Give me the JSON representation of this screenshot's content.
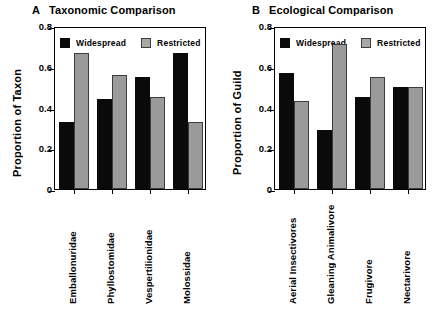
{
  "figure": {
    "background": "#ffffff",
    "series_colors": {
      "widespread": "#0a0a0a",
      "restricted": "#9a9a9a",
      "restricted_border": "#3c3c3c",
      "axis": "#000000"
    }
  },
  "panels": [
    {
      "id": "A",
      "panel_letter": "A",
      "title": "Taxonomic Comparison",
      "ylabel": "Proportion of Taxon",
      "legend": [
        {
          "key": "widespread",
          "label": "Widespread"
        },
        {
          "key": "restricted",
          "label": "Restricted"
        }
      ],
      "yticks": [
        "0",
        "0.2",
        "0.4",
        "0.6",
        "0.8"
      ],
      "categories": [
        "Emballonuridae",
        "Phyllostomidae",
        "Vespertilionidae",
        "Molossidae"
      ]
    },
    {
      "id": "B",
      "panel_letter": "B",
      "title": "Ecological Comparison",
      "ylabel": "Proportion of Guild",
      "legend": [
        {
          "key": "widespread",
          "label": "Widespread"
        },
        {
          "key": "restricted",
          "label": "Restricted"
        }
      ],
      "yticks": [
        "0",
        "0.2",
        "0.4",
        "0.6",
        "0.8"
      ],
      "categories": [
        "Aerial Insectivores",
        "Gleaning Animalivore",
        "Frugivore",
        "Nectarivore"
      ]
    }
  ],
  "chart_data": [
    {
      "type": "bar",
      "panel": "A",
      "title": "Taxonomic Comparison",
      "xlabel": "",
      "ylabel": "Proportion of Taxon",
      "ylim": [
        0,
        0.8
      ],
      "yticks": [
        0,
        0.2,
        0.4,
        0.6,
        0.8
      ],
      "grid": false,
      "legend_position": "top-inside",
      "categories": [
        "Emballonuridae",
        "Phyllostomidae",
        "Vespertilionidae",
        "Molossidae"
      ],
      "series": [
        {
          "name": "Widespread",
          "color": "#0a0a0a",
          "values": [
            0.33,
            0.44,
            0.55,
            0.67
          ]
        },
        {
          "name": "Restricted",
          "color": "#9a9a9a",
          "values": [
            0.67,
            0.56,
            0.45,
            0.33
          ]
        }
      ]
    },
    {
      "type": "bar",
      "panel": "B",
      "title": "Ecological Comparison",
      "xlabel": "",
      "ylabel": "Proportion of Guild",
      "ylim": [
        0,
        0.8
      ],
      "yticks": [
        0,
        0.2,
        0.4,
        0.6,
        0.8
      ],
      "grid": false,
      "legend_position": "top-inside",
      "categories": [
        "Aerial Insectivores",
        "Gleaning Animalivore",
        "Frugivore",
        "Nectarivore"
      ],
      "series": [
        {
          "name": "Widespread",
          "color": "#0a0a0a",
          "values": [
            0.57,
            0.29,
            0.45,
            0.5
          ]
        },
        {
          "name": "Restricted",
          "color": "#9a9a9a",
          "values": [
            0.43,
            0.71,
            0.55,
            0.5
          ]
        }
      ]
    }
  ]
}
